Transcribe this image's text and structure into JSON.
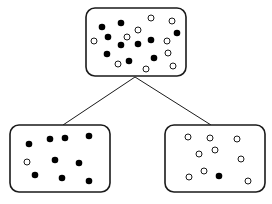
{
  "diagram": {
    "type": "tree-split",
    "colors": {
      "stroke": "#1a1a1a",
      "filled": "#000000",
      "open_fill": "#ffffff",
      "background": "#ffffff"
    },
    "edges": [
      {
        "from": "parent",
        "to": "left-child",
        "x1": 135,
        "y1": 77,
        "x2": 63,
        "y2": 125
      },
      {
        "from": "parent",
        "to": "right-child",
        "x1": 135,
        "y1": 77,
        "x2": 211,
        "y2": 125
      }
    ],
    "nodes": [
      {
        "id": "parent",
        "box": {
          "x": 86,
          "y": 8,
          "w": 100,
          "h": 68,
          "r": 9
        },
        "filled_count": 10,
        "open_count": 10,
        "filled": [
          [
            102,
            27
          ],
          [
            121,
            23
          ],
          [
            108,
            37
          ],
          [
            121,
            45
          ],
          [
            138,
            44
          ],
          [
            151,
            40
          ],
          [
            177,
            33
          ],
          [
            107,
            54
          ],
          [
            129,
            61
          ],
          [
            154,
            58
          ]
        ],
        "open": [
          [
            151,
            18
          ],
          [
            172,
            21
          ],
          [
            138,
            30
          ],
          [
            127,
            37
          ],
          [
            94,
            41
          ],
          [
            167,
            41
          ],
          [
            168,
            53
          ],
          [
            118,
            64
          ],
          [
            146,
            69
          ],
          [
            173,
            66
          ]
        ]
      },
      {
        "id": "left-child",
        "box": {
          "x": 10,
          "y": 125,
          "w": 100,
          "h": 67,
          "r": 9
        },
        "filled_count": 9,
        "open_count": 1,
        "filled": [
          [
            29,
            144
          ],
          [
            50,
            139
          ],
          [
            65,
            138
          ],
          [
            89,
            136
          ],
          [
            55,
            160
          ],
          [
            79,
            163
          ],
          [
            35,
            175
          ],
          [
            62,
            178
          ],
          [
            89,
            181
          ]
        ],
        "open": [
          [
            27,
            162
          ]
        ]
      },
      {
        "id": "right-child",
        "box": {
          "x": 165,
          "y": 125,
          "w": 100,
          "h": 67,
          "r": 9
        },
        "filled_count": 1,
        "open_count": 9,
        "filled": [
          [
            219,
            176
          ]
        ],
        "open": [
          [
            188,
            137
          ],
          [
            210,
            138
          ],
          [
            237,
            139
          ],
          [
            199,
            154
          ],
          [
            215,
            150
          ],
          [
            241,
            159
          ],
          [
            204,
            171
          ],
          [
            189,
            177
          ],
          [
            248,
            181
          ]
        ]
      }
    ]
  }
}
